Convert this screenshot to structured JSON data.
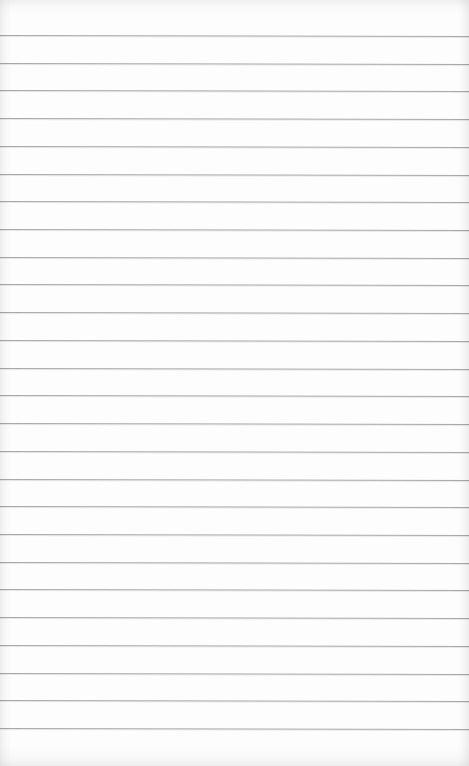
{
  "paper": {
    "description": "Blank lined notebook paper",
    "background_color": "#fdfdfd",
    "line_color": "#a9a9a9",
    "line_count": 26,
    "first_line_y": 35,
    "line_spacing": 27.72,
    "line_thickness": 1
  }
}
